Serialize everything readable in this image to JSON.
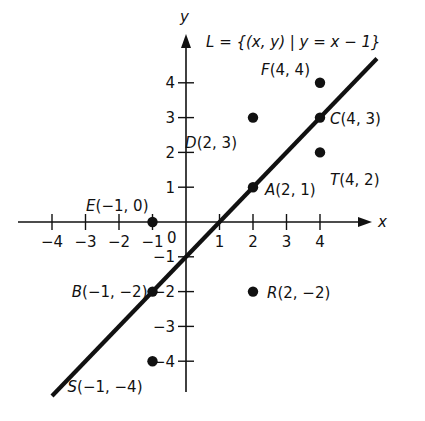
{
  "diagram": {
    "title": "L = {(x, y) | y = x − 1}",
    "title_parts": {
      "L": "L",
      "eq": "=",
      "set": "{(x, y) | y = x − 1}"
    },
    "x_axis_label": "x",
    "y_axis_label": "y",
    "origin_label": "0",
    "x_ticks": [
      {
        "v": -4,
        "label": "−4"
      },
      {
        "v": -3,
        "label": "−3"
      },
      {
        "v": -2,
        "label": "−2"
      },
      {
        "v": -1,
        "label": "−1"
      },
      {
        "v": 1,
        "label": "1"
      },
      {
        "v": 2,
        "label": "2"
      },
      {
        "v": 3,
        "label": "3"
      },
      {
        "v": 4,
        "label": "4"
      }
    ],
    "y_ticks": [
      {
        "v": 4,
        "label": "4"
      },
      {
        "v": 3,
        "label": "3"
      },
      {
        "v": 2,
        "label": "2"
      },
      {
        "v": 1,
        "label": "1"
      },
      {
        "v": -1,
        "label": "−1"
      },
      {
        "v": -2,
        "label": "−2"
      },
      {
        "v": -3,
        "label": "−3"
      },
      {
        "v": -4,
        "label": "−4"
      }
    ],
    "line": {
      "equation": "y = x - 1",
      "from": [
        -4,
        -5
      ],
      "to": [
        5.7,
        4.7
      ]
    },
    "points": [
      {
        "name": "F",
        "x": 4,
        "y": 4,
        "label": "F(4, 4)",
        "on_line": false
      },
      {
        "name": "D",
        "x": 2,
        "y": 3,
        "label": "D(2, 3)",
        "on_line": false
      },
      {
        "name": "C",
        "x": 4,
        "y": 3,
        "label": "C(4, 3)",
        "on_line": true
      },
      {
        "name": "T",
        "x": 4,
        "y": 2,
        "label": "T(4, 2)",
        "on_line": false
      },
      {
        "name": "A",
        "x": 2,
        "y": 1,
        "label": "A(2, 1)",
        "on_line": true
      },
      {
        "name": "E",
        "x": -1,
        "y": 0,
        "label": "E(−1, 0)",
        "on_line": false
      },
      {
        "name": "B",
        "x": -1,
        "y": -2,
        "label": "B(−1, −2)",
        "on_line": true
      },
      {
        "name": "R",
        "x": 2,
        "y": -2,
        "label": "R(2, −2)",
        "on_line": false
      },
      {
        "name": "S",
        "x": -1,
        "y": -4,
        "label": "S(−1, −4)",
        "on_line": false
      }
    ],
    "colors": {
      "ink": "#111111",
      "background": "#ffffff"
    }
  }
}
